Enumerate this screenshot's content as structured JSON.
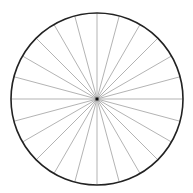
{
  "diagram": {
    "type": "divided-circle",
    "center": {
      "x": 97,
      "y": 99
    },
    "radius": 86,
    "spoke_count": 24,
    "sector_angle_deg": 15,
    "colors": {
      "background": "#ffffff",
      "circle_stroke": "#222222",
      "spoke_stroke": "#aaaaaa",
      "center_dot": "#111111"
    },
    "stroke_widths": {
      "circle": 1.6,
      "spoke": 0.9
    },
    "center_dot_size": 3
  }
}
